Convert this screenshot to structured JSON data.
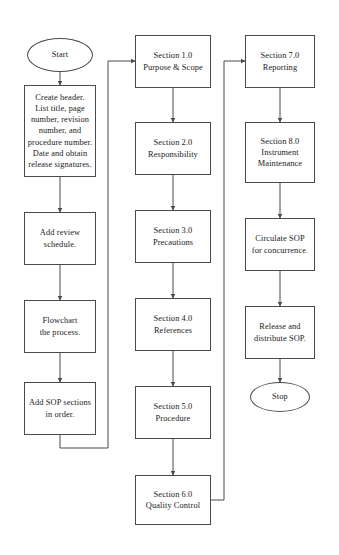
{
  "diagram": {
    "type": "flowchart",
    "background_color": "#ffffff",
    "stroke_color": "#4a4a4a",
    "text_color": "#1a1a1a"
  },
  "nodes": {
    "start": {
      "label": "Start",
      "shape": "ellipse"
    },
    "create_header": {
      "label": "Create header.\nList title, page\nnumber, revision\nnumber, and\nprocedure number.\nDate and obtain\nrelease signatures.",
      "shape": "rectangle"
    },
    "add_review_schedule": {
      "label": "Add review\nschedule.",
      "shape": "rectangle"
    },
    "flowchart_process": {
      "label": "Flowchart\nthe process.",
      "shape": "rectangle"
    },
    "add_sop_sections": {
      "label": "Add SOP sections\nin order.",
      "shape": "rectangle"
    },
    "section_1": {
      "label": "Section 1.0\nPurpose & Scope",
      "shape": "rectangle"
    },
    "section_2": {
      "label": "Section 2.0\nResponsibility",
      "shape": "rectangle"
    },
    "section_3": {
      "label": "Section 3.0\nPrecautions",
      "shape": "rectangle"
    },
    "section_4": {
      "label": "Section 4.0\nReferences",
      "shape": "rectangle"
    },
    "section_5": {
      "label": "Section 5.0\nProcedure",
      "shape": "rectangle"
    },
    "section_6": {
      "label": "Section 6.0\nQuality Control",
      "shape": "rectangle"
    },
    "section_7": {
      "label": "Section 7.0\nReporting",
      "shape": "rectangle"
    },
    "section_8": {
      "label": "Section 8.0\nInstrument\nMaintenance",
      "shape": "rectangle"
    },
    "circulate_sop": {
      "label": "Circulate SOP\nfor concurrence.",
      "shape": "rectangle"
    },
    "release_sop": {
      "label": "Release and\ndistribute SOP.",
      "shape": "rectangle"
    },
    "stop": {
      "label": "Stop",
      "shape": "ellipse"
    }
  }
}
